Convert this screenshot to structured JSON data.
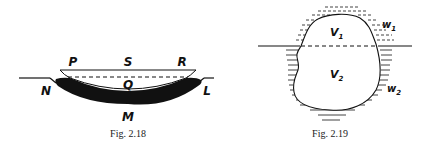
{
  "figures": [
    {
      "id": "fig-2-18",
      "caption": "Fig. 2.18",
      "labels": {
        "P": "P",
        "S": "S",
        "R": "R",
        "Q": "Q",
        "N": "N",
        "L": "L",
        "M": "M"
      }
    },
    {
      "id": "fig-2-19",
      "caption": "Fig. 2.19",
      "labels": {
        "V1": "V",
        "V1_sub": "1",
        "V2": "V",
        "V2_sub": "2",
        "w1": "w",
        "w1_sub": "1",
        "w2": "w",
        "w2_sub": "2"
      }
    }
  ],
  "colors": {
    "ink": "#111111",
    "background": "#ffffff"
  }
}
